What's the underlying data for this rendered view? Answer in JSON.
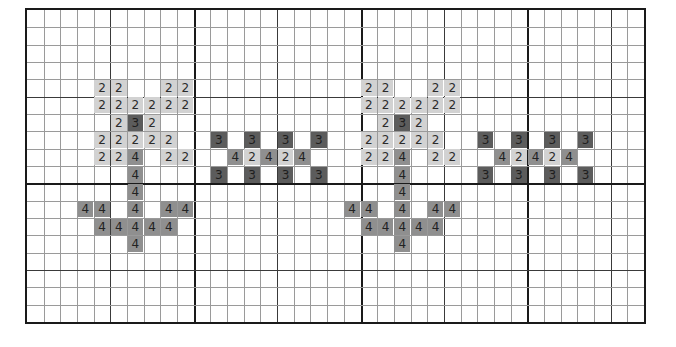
{
  "pattern": {
    "title": "",
    "grid": {
      "columns": 37,
      "rows": 18,
      "minor_every": 1,
      "medium_every": 5,
      "heavy_every": 10
    },
    "colors": {
      "grid_line": "#9a9a9a",
      "medium_line": "#3a3a3a",
      "heavy_line": "#1a1a1a",
      "symbol_2": "#d2d2d2",
      "symbol_3": "#5c5c5c",
      "symbol_4": "#8f8f8f"
    },
    "legend_symbols": [
      "2",
      "3",
      "4"
    ],
    "motifs": [
      {
        "name": "flower-1",
        "cells": [
          [
            4,
            4,
            "2"
          ],
          [
            4,
            5,
            "2"
          ],
          [
            4,
            8,
            "2"
          ],
          [
            4,
            9,
            "2"
          ],
          [
            5,
            4,
            "2"
          ],
          [
            5,
            5,
            "2"
          ],
          [
            5,
            6,
            "2"
          ],
          [
            5,
            7,
            "2"
          ],
          [
            5,
            8,
            "2"
          ],
          [
            5,
            9,
            "2"
          ],
          [
            6,
            5,
            "2"
          ],
          [
            6,
            6,
            "3"
          ],
          [
            6,
            7,
            "2"
          ],
          [
            7,
            4,
            "2"
          ],
          [
            7,
            5,
            "2"
          ],
          [
            7,
            6,
            "2"
          ],
          [
            7,
            7,
            "2"
          ],
          [
            7,
            8,
            "2"
          ],
          [
            8,
            4,
            "2"
          ],
          [
            8,
            5,
            "2"
          ],
          [
            8,
            6,
            "4"
          ],
          [
            8,
            8,
            "2"
          ],
          [
            8,
            9,
            "2"
          ],
          [
            9,
            6,
            "4"
          ],
          [
            10,
            6,
            "4"
          ],
          [
            11,
            3,
            "4"
          ],
          [
            11,
            4,
            "4"
          ],
          [
            11,
            6,
            "4"
          ],
          [
            11,
            8,
            "4"
          ],
          [
            11,
            9,
            "4"
          ],
          [
            12,
            4,
            "4"
          ],
          [
            12,
            5,
            "4"
          ],
          [
            12,
            6,
            "4"
          ],
          [
            12,
            7,
            "4"
          ],
          [
            12,
            8,
            "4"
          ],
          [
            13,
            6,
            "4"
          ]
        ]
      },
      {
        "name": "cross-band-1",
        "cells": [
          [
            7,
            11,
            "3"
          ],
          [
            7,
            13,
            "3"
          ],
          [
            7,
            15,
            "3"
          ],
          [
            7,
            17,
            "3"
          ],
          [
            8,
            12,
            "4"
          ],
          [
            8,
            13,
            "2"
          ],
          [
            8,
            14,
            "4"
          ],
          [
            8,
            15,
            "2"
          ],
          [
            8,
            16,
            "4"
          ],
          [
            9,
            11,
            "3"
          ],
          [
            9,
            13,
            "3"
          ],
          [
            9,
            15,
            "3"
          ],
          [
            9,
            17,
            "3"
          ]
        ]
      },
      {
        "name": "flower-2",
        "cells": [
          [
            4,
            20,
            "2"
          ],
          [
            4,
            21,
            "2"
          ],
          [
            4,
            24,
            "2"
          ],
          [
            4,
            25,
            "2"
          ],
          [
            5,
            20,
            "2"
          ],
          [
            5,
            21,
            "2"
          ],
          [
            5,
            22,
            "2"
          ],
          [
            5,
            23,
            "2"
          ],
          [
            5,
            24,
            "2"
          ],
          [
            5,
            25,
            "2"
          ],
          [
            6,
            21,
            "2"
          ],
          [
            6,
            22,
            "3"
          ],
          [
            6,
            23,
            "2"
          ],
          [
            7,
            20,
            "2"
          ],
          [
            7,
            21,
            "2"
          ],
          [
            7,
            22,
            "2"
          ],
          [
            7,
            23,
            "2"
          ],
          [
            7,
            24,
            "2"
          ],
          [
            8,
            20,
            "2"
          ],
          [
            8,
            21,
            "2"
          ],
          [
            8,
            22,
            "4"
          ],
          [
            8,
            24,
            "2"
          ],
          [
            8,
            25,
            "2"
          ],
          [
            9,
            22,
            "4"
          ],
          [
            10,
            22,
            "4"
          ],
          [
            11,
            19,
            "4"
          ],
          [
            11,
            20,
            "4"
          ],
          [
            11,
            22,
            "4"
          ],
          [
            11,
            24,
            "4"
          ],
          [
            11,
            25,
            "4"
          ],
          [
            12,
            20,
            "4"
          ],
          [
            12,
            21,
            "4"
          ],
          [
            12,
            22,
            "4"
          ],
          [
            12,
            23,
            "4"
          ],
          [
            12,
            24,
            "4"
          ],
          [
            13,
            22,
            "4"
          ]
        ]
      },
      {
        "name": "cross-band-2",
        "cells": [
          [
            7,
            27,
            "3"
          ],
          [
            7,
            29,
            "3"
          ],
          [
            7,
            31,
            "3"
          ],
          [
            7,
            33,
            "3"
          ],
          [
            8,
            28,
            "4"
          ],
          [
            8,
            29,
            "2"
          ],
          [
            8,
            30,
            "4"
          ],
          [
            8,
            31,
            "2"
          ],
          [
            8,
            32,
            "4"
          ],
          [
            9,
            27,
            "3"
          ],
          [
            9,
            29,
            "3"
          ],
          [
            9,
            31,
            "3"
          ],
          [
            9,
            33,
            "3"
          ]
        ]
      }
    ]
  }
}
